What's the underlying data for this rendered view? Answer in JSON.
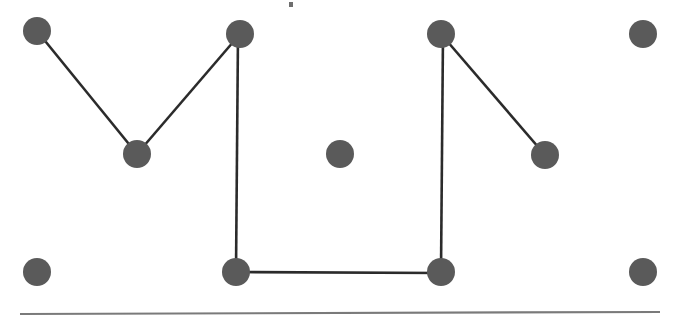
{
  "figure": {
    "canvas_width": 679,
    "canvas_height": 328,
    "background_color": "#ffffff"
  },
  "style": {
    "node_fill": "#5a5a5a",
    "node_radius": 14,
    "edge_color": "#2b2b2b",
    "edge_width": 2.6,
    "baseline_color": "#7a7a7a",
    "baseline_width": 2.2,
    "speck_color": "#6e6e6e"
  },
  "chart_data": {
    "type": "scatter",
    "title": "",
    "xlabel": "",
    "ylabel": "",
    "xlim": [
      0,
      679
    ],
    "ylim": [
      0,
      328
    ],
    "grid": false,
    "legend": null,
    "nodes": [
      {
        "id": "n1",
        "label": "top-left",
        "x": 37,
        "y": 31,
        "r": 14,
        "color": "#5a5a5a"
      },
      {
        "id": "n2",
        "label": "top-mid-left",
        "x": 240,
        "y": 34,
        "r": 14,
        "color": "#5a5a5a"
      },
      {
        "id": "n3",
        "label": "top-mid-right",
        "x": 441,
        "y": 34,
        "r": 14,
        "color": "#5a5a5a"
      },
      {
        "id": "n4",
        "label": "top-right",
        "x": 643,
        "y": 34,
        "r": 14,
        "color": "#5a5a5a"
      },
      {
        "id": "n5",
        "label": "valley-left",
        "x": 137,
        "y": 154,
        "r": 14,
        "color": "#5a5a5a"
      },
      {
        "id": "n6",
        "label": "center-isolated",
        "x": 340,
        "y": 154,
        "r": 14,
        "color": "#5a5a5a"
      },
      {
        "id": "n7",
        "label": "mid-right",
        "x": 545,
        "y": 155,
        "r": 14,
        "color": "#5a5a5a"
      },
      {
        "id": "n8",
        "label": "bottom-left",
        "x": 37,
        "y": 272,
        "r": 14,
        "color": "#5a5a5a"
      },
      {
        "id": "n9",
        "label": "bottom-mid-left",
        "x": 236,
        "y": 272,
        "r": 14,
        "color": "#5a5a5a"
      },
      {
        "id": "n10",
        "label": "bottom-mid-right",
        "x": 441,
        "y": 272,
        "r": 14,
        "color": "#5a5a5a"
      },
      {
        "id": "n11",
        "label": "bottom-right",
        "x": 643,
        "y": 272,
        "r": 14,
        "color": "#5a5a5a"
      }
    ],
    "edges": [
      {
        "id": "e1",
        "from": "n1",
        "to": "n5",
        "x1": 37,
        "y1": 31,
        "x2": 137,
        "y2": 154
      },
      {
        "id": "e2",
        "from": "n5",
        "to": "n2",
        "x1": 137,
        "y1": 154,
        "x2": 240,
        "y2": 34
      },
      {
        "id": "e3",
        "from": "n2",
        "to": "n9",
        "x1": 238,
        "y1": 34,
        "x2": 236,
        "y2": 272
      },
      {
        "id": "e4",
        "from": "n9",
        "to": "n10",
        "x1": 236,
        "y1": 272,
        "x2": 441,
        "y2": 273
      },
      {
        "id": "e5",
        "from": "n10",
        "to": "n3",
        "x1": 441,
        "y1": 272,
        "x2": 443,
        "y2": 34
      },
      {
        "id": "e6",
        "from": "n3",
        "to": "n7",
        "x1": 441,
        "y1": 34,
        "x2": 545,
        "y2": 155
      }
    ],
    "baseline": {
      "x1": 20,
      "y1": 314,
      "x2": 660,
      "y2": 312
    },
    "specks": [
      {
        "id": "s1",
        "x": 289,
        "y": 2,
        "w": 4,
        "h": 5
      }
    ]
  }
}
